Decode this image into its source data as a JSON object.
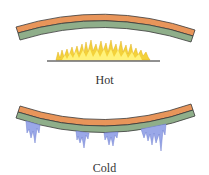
{
  "diagram": {
    "panels": [
      {
        "label": "Hot",
        "bend": "up",
        "source": "flames"
      },
      {
        "label": "Cold",
        "bend": "down",
        "source": "icicles"
      }
    ]
  },
  "colors": {
    "metal_top": "#e8955a",
    "metal_bottom": "#8fae8a",
    "outline": "#3a3a3a",
    "flame_outer": "#f4d23a",
    "flame_inner": "#fff27a",
    "ice": "#9aa8e8",
    "ice_edge": "#6f7fd0",
    "burner_line": "#222222"
  }
}
